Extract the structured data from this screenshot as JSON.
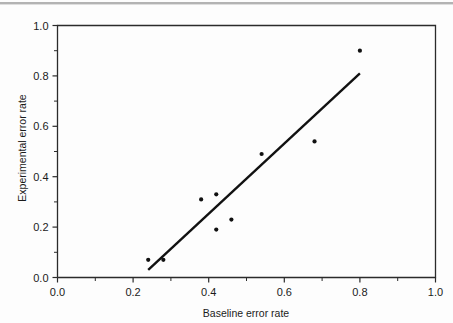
{
  "figure": {
    "background_color": "#fdfdfd",
    "ink_color": "#111111",
    "has_top_rule": true
  },
  "chart_data": {
    "type": "scatter",
    "title": "",
    "xlabel": "Baseline error rate",
    "ylabel": "Experimental error rate",
    "xlim": [
      0.0,
      1.0
    ],
    "ylim": [
      0.0,
      1.0
    ],
    "grid": false,
    "legend": null,
    "xticks": [
      "0.0",
      "0.2",
      "0.4",
      "0.6",
      "0.8",
      "1.0"
    ],
    "xtick_values": [
      0.0,
      0.2,
      0.4,
      0.6,
      0.8,
      1.0
    ],
    "yticks": [
      "0.0",
      "0.2",
      "0.4",
      "0.6",
      "0.8",
      "1.0"
    ],
    "ytick_values": [
      0.0,
      0.2,
      0.4,
      0.6,
      0.8,
      1.0
    ],
    "minor_ticks_per_interval": 1,
    "points": [
      {
        "x": 0.24,
        "y": 0.07
      },
      {
        "x": 0.28,
        "y": 0.07
      },
      {
        "x": 0.38,
        "y": 0.31
      },
      {
        "x": 0.42,
        "y": 0.33
      },
      {
        "x": 0.42,
        "y": 0.19
      },
      {
        "x": 0.46,
        "y": 0.23
      },
      {
        "x": 0.54,
        "y": 0.49
      },
      {
        "x": 0.68,
        "y": 0.54
      },
      {
        "x": 0.8,
        "y": 0.9
      }
    ],
    "marker": {
      "shape": "circle",
      "size_px": 3.0,
      "color": "#111111"
    },
    "trend_line": {
      "type": "linear-fit",
      "x_start": 0.24,
      "y_start": 0.03,
      "x_end": 0.8,
      "y_end": 0.81,
      "color": "#111111",
      "width_px": 2.4
    }
  }
}
